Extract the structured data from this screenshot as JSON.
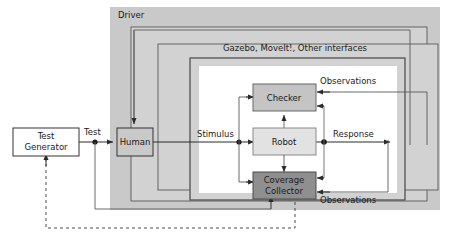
{
  "diagram": {
    "colors": {
      "driver_fill": "#c9c9c9",
      "frame_fill": "#d2d2d2",
      "inner_fill": "#ffffff",
      "checker_fill": "#c4c4c4",
      "robot_fill": "#e2e2e2",
      "coverage_fill": "#8f8f8f",
      "generator_fill": "#ffffff",
      "human_fill": "#c9c9c9",
      "stroke": "#555555",
      "line": "#3a3a3a",
      "text": "#1a1a1a"
    },
    "containers": [
      {
        "id": "driver",
        "label": "Driver"
      },
      {
        "id": "outer-frame",
        "label": ""
      },
      {
        "id": "interfaces",
        "label": "Gazebo, MoveIt!, Other interfaces"
      },
      {
        "id": "inner-frame",
        "label": ""
      }
    ],
    "blocks": [
      {
        "id": "test-generator",
        "label_line1": "Test",
        "label_line2": "Generator"
      },
      {
        "id": "human",
        "label_line1": "Human",
        "label_line2": ""
      },
      {
        "id": "checker",
        "label_line1": "Checker",
        "label_line2": ""
      },
      {
        "id": "robot",
        "label_line1": "Robot",
        "label_line2": ""
      },
      {
        "id": "coverage-collector",
        "label_line1": "Coverage",
        "label_line2": "Collector"
      }
    ],
    "edge_labels": [
      {
        "id": "test",
        "text": "Test"
      },
      {
        "id": "stimulus",
        "text": "Stimulus"
      },
      {
        "id": "response",
        "text": "Response"
      },
      {
        "id": "observations-top",
        "text": "Observations"
      },
      {
        "id": "observations-bottom",
        "text": "Observations"
      }
    ]
  }
}
